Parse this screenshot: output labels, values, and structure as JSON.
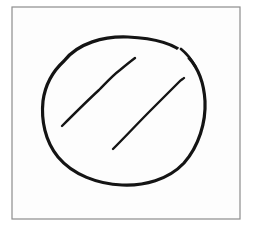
{
  "document": {
    "kind": "scanned-hand-drawing",
    "title": "Hand-drawn circle with two diagonal strokes",
    "width": 254,
    "height": 230,
    "background_color": "#ffffff",
    "paper_color": "#fdfdfd"
  },
  "frame": {
    "name": "drawing-border",
    "stroke_color": "#8d8d8d",
    "stroke_width": 1.2,
    "fill_color": "#fdfdfd",
    "x": 12,
    "y": 7,
    "width": 228,
    "height": 212
  },
  "ink": {
    "color": "#141414",
    "style": "hand-drawn pen stroke"
  },
  "shapes": [
    {
      "id": "ellipse-outline",
      "name": "hand-drawn-ellipse",
      "type": "closed-freehand-ellipse",
      "label": "Circle outline",
      "center_x": 124,
      "center_y": 111,
      "radius_x": 81,
      "radius_y": 73,
      "stroke_width": 3.2,
      "has_gap": true,
      "gap_location": "top-right",
      "path": "M 64 61 C 78 43, 104 36, 128 37 C 152 38, 174 43, 186 55 C 187 56, 188 57, 189 58 C 198 68, 204 84, 205 101 C 206 122, 199 146, 184 163 C 168 180, 144 186, 122 185 C 98 184, 73 175, 58 157 C 45 141, 41 120, 43 101 C 45 86, 52 72, 64 61 Z"
    },
    {
      "id": "stroke-left",
      "name": "diagonal-stroke-left",
      "type": "freehand-line",
      "label": "Left diagonal slash",
      "start_x": 62,
      "start_y": 126,
      "end_x": 135,
      "end_y": 58,
      "stroke_width": 2.4,
      "path": "M 62 126 C 74 114, 87 101, 99 90 C 105 84, 112 76, 120 70 C 126 65, 131 61, 135 58"
    },
    {
      "id": "stroke-right",
      "name": "diagonal-stroke-right",
      "type": "freehand-line",
      "label": "Right diagonal slash",
      "start_x": 113,
      "start_y": 149,
      "end_x": 184,
      "end_y": 78,
      "stroke_width": 2.4,
      "path": "M 113 149 C 126 136, 139 122, 152 109 C 162 99, 172 89, 179 82 C 181 80, 183 79, 184 78"
    }
  ],
  "annotations": {
    "alt_text": "A roughly drawn circle containing two parallel diagonal lines, enclosed in a thin rectangular border.",
    "stroke_count": "3"
  }
}
